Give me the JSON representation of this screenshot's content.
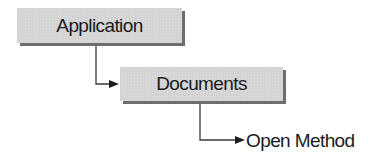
{
  "diagram": {
    "type": "object-hierarchy",
    "nodes": [
      {
        "id": "application",
        "label": "Application",
        "style": "box"
      },
      {
        "id": "documents",
        "label": "Documents",
        "style": "box"
      },
      {
        "id": "open_method",
        "label": "Open Method",
        "style": "text"
      }
    ],
    "edges": [
      {
        "from": "application",
        "to": "documents",
        "style": "elbow-arrow"
      },
      {
        "from": "documents",
        "to": "open_method",
        "style": "elbow-arrow"
      }
    ],
    "colors": {
      "box_fill": "#d4d4d4",
      "box_shadow": "#6e6e6e",
      "line": "#3a3a3a",
      "text": "#1a1a1a"
    }
  }
}
